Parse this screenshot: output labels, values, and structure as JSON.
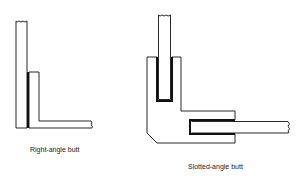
{
  "figure": {
    "diagrams": [
      {
        "id": "right-angle-butt",
        "caption": "Right-angle butt"
      },
      {
        "id": "slotted-angle-butt",
        "caption": "Slotted-angle butt"
      }
    ],
    "colors": {
      "line": "#111111",
      "background": "#ffffff"
    }
  }
}
